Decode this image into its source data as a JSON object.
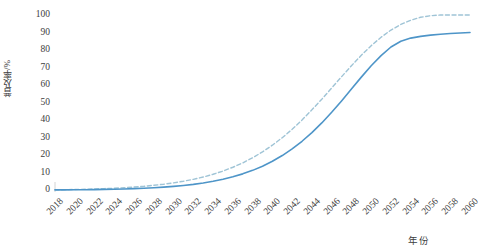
{
  "chart_data": {
    "type": "line",
    "title": "",
    "xlabel": "年份",
    "ylabel": "普及率/%",
    "xlim": [
      2018,
      2060
    ],
    "ylim": [
      0,
      100
    ],
    "grid": false,
    "legend": "none",
    "x_tick_labels": [
      "2018",
      "2020",
      "2022",
      "2024",
      "2026",
      "2028",
      "2030",
      "2032",
      "2034",
      "2036",
      "2038",
      "2040",
      "2042",
      "2044",
      "2046",
      "2048",
      "2050",
      "2052",
      "2054",
      "2056",
      "2058",
      "2060"
    ],
    "y_tick_labels": [
      "0",
      "10",
      "20",
      "30",
      "40",
      "50",
      "60",
      "70",
      "80",
      "90",
      "100"
    ],
    "x": [
      2018,
      2019,
      2020,
      2021,
      2022,
      2023,
      2024,
      2025,
      2026,
      2027,
      2028,
      2029,
      2030,
      2031,
      2032,
      2033,
      2034,
      2035,
      2036,
      2037,
      2038,
      2039,
      2040,
      2041,
      2042,
      2043,
      2044,
      2045,
      2046,
      2047,
      2048,
      2049,
      2050,
      2051,
      2052,
      2053,
      2054,
      2055,
      2056,
      2057,
      2058,
      2059,
      2060
    ],
    "series": [
      {
        "name": "上限情景",
        "style": "dashed",
        "color": "#9fc4d6",
        "values": [
          0.1,
          0.2,
          0.3,
          0.4,
          0.6,
          0.8,
          1.0,
          1.3,
          1.7,
          2.1,
          2.7,
          3.3,
          4.1,
          5.0,
          6.1,
          7.4,
          9.0,
          10.8,
          13.0,
          15.5,
          18.4,
          21.8,
          25.6,
          29.9,
          34.7,
          40.0,
          45.8,
          51.9,
          58.3,
          64.7,
          71.0,
          77.0,
          82.5,
          87.3,
          91.4,
          94.6,
          97.0,
          98.7,
          99.6,
          100.0,
          100.0,
          100.0,
          100.0
        ]
      },
      {
        "name": "基准情景",
        "style": "solid",
        "color": "#4e95c8",
        "values": [
          0.05,
          0.08,
          0.12,
          0.17,
          0.24,
          0.33,
          0.44,
          0.58,
          0.76,
          0.99,
          1.27,
          1.62,
          2.05,
          2.58,
          3.23,
          4.02,
          4.98,
          6.14,
          7.54,
          9.22,
          11.22,
          13.6,
          16.4,
          19.68,
          23.48,
          27.85,
          32.8,
          38.33,
          44.4,
          50.9,
          57.7,
          64.5,
          71.0,
          76.8,
          81.7,
          85.0,
          86.8,
          87.8,
          88.5,
          89.0,
          89.4,
          89.7,
          90.0
        ]
      }
    ]
  },
  "plot_geometry": {
    "left": 55,
    "right": 470,
    "top": 15,
    "bottom": 190
  }
}
